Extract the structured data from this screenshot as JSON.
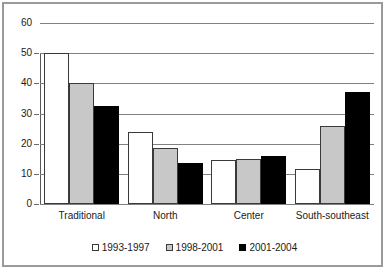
{
  "chart_data": {
    "type": "bar",
    "title": "",
    "subtitle": "",
    "xlabel": "",
    "ylabel": "",
    "ylim": [
      0,
      60
    ],
    "ytick_labels": [
      "0",
      "10",
      "20",
      "30",
      "40",
      "50",
      "60"
    ],
    "yticks": [
      0,
      10,
      20,
      30,
      40,
      50,
      60
    ],
    "grid": true,
    "legend_position": "bottom",
    "categories": [
      "Traditional",
      "North",
      "Center",
      "South-southeast"
    ],
    "series": [
      {
        "name": "1993-1997",
        "color": "#ffffff",
        "values": [
          50,
          24,
          14.5,
          11.5
        ]
      },
      {
        "name": "1998-2001",
        "color": "#c8c8c8",
        "values": [
          40,
          18.5,
          15,
          26
        ]
      },
      {
        "name": "2001-2004",
        "color": "#000000",
        "values": [
          32.5,
          13.5,
          16,
          37
        ]
      }
    ]
  },
  "legend": {
    "items": [
      {
        "label": "1993-1997",
        "swatch": "white-square-icon"
      },
      {
        "label": "1998-2001",
        "swatch": "gray-square-icon"
      },
      {
        "label": "2001-2004",
        "swatch": "black-square-icon"
      }
    ]
  }
}
